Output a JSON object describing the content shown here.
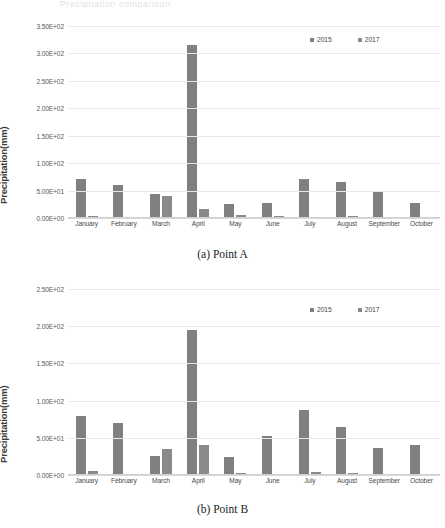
{
  "top_cut_text": "Precipitation comparison",
  "figures": [
    {
      "id": "a",
      "caption": "(a) Point A",
      "ylabel": "Precipitation(mm)",
      "legend": [
        {
          "label": "2015",
          "color": "#808080"
        },
        {
          "label": "2017",
          "color": "#8a8a8a"
        }
      ],
      "yticks": [
        "0.00E+00",
        "5.00E+01",
        "1.00E+02",
        "1.50E+02",
        "2.00E+02",
        "2.50E+02",
        "3.00E+02",
        "3.50E+02"
      ],
      "chart_data": {
        "type": "bar",
        "title": "(a) Point A",
        "xlabel": "",
        "ylabel": "Precipitation(mm)",
        "ylim": [
          0,
          350
        ],
        "ytick_values": [
          0,
          50,
          100,
          150,
          200,
          250,
          300,
          350
        ],
        "grid": true,
        "legend_position": "top-right",
        "categories": [
          "January",
          "February",
          "March",
          "April",
          "May",
          "June",
          "July",
          "August",
          "September",
          "October"
        ],
        "series": [
          {
            "name": "2015",
            "values": [
              72,
              60,
              43,
              316,
              26,
              27,
              72,
              66,
              50,
              27
            ]
          },
          {
            "name": "2017",
            "values": [
              3,
              1.5,
              40,
              17,
              6,
              3,
              2,
              4.5,
              0.8,
              1.2
            ]
          }
        ]
      }
    },
    {
      "id": "b",
      "caption": "(b) Point B",
      "ylabel": "Precipitation(mm)",
      "legend": [
        {
          "label": "2015",
          "color": "#808080"
        },
        {
          "label": "2017",
          "color": "#8a8a8a"
        }
      ],
      "yticks": [
        "0.00E+00",
        "5.00E+01",
        "1.00E+02",
        "1.50E+02",
        "2.00E+02",
        "2.50E+02"
      ],
      "chart_data": {
        "type": "bar",
        "title": "(b) Point B",
        "xlabel": "",
        "ylabel": "Precipitation(mm)",
        "ylim": [
          0,
          250
        ],
        "ytick_values": [
          0,
          50,
          100,
          150,
          200,
          250
        ],
        "grid": true,
        "legend_position": "top-right",
        "categories": [
          "January",
          "February",
          "March",
          "April",
          "May",
          "June",
          "July",
          "August",
          "September",
          "October"
        ],
        "series": [
          {
            "name": "2015",
            "values": [
              79,
              70,
              25,
              195,
              24,
              53,
              88,
              65,
              36,
              40
            ]
          },
          {
            "name": "2017",
            "values": [
              5,
              2,
              35,
              40,
              2.5,
              1,
              4.5,
              3,
              1.5,
              1
            ]
          }
        ]
      }
    }
  ]
}
